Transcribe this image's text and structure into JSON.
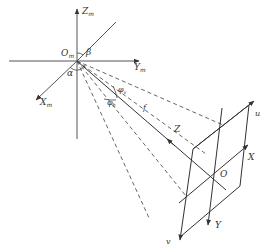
{
  "diagram": {
    "type": "camera-geometry",
    "labels": {
      "zm": "Z",
      "zm_sub": "m",
      "ym": "Y",
      "ym_sub": "m",
      "xm": "X",
      "xm_sub": "m",
      "om": "O",
      "om_sub": "m",
      "alpha": "α",
      "beta": "β",
      "phi_v": "φ",
      "phi_v_sub": "v",
      "phi_h": "φ",
      "phi_h_sub": "h",
      "f": "f",
      "z": "Z",
      "u": "u",
      "v": "v",
      "x": "X",
      "y": "Y",
      "o": "O"
    },
    "colors": {
      "line": "#3a3a3a",
      "axis": "#555555",
      "dashed": "#555555"
    }
  }
}
